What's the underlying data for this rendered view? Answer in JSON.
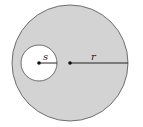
{
  "diagram": {
    "outer_circle": {
      "radius_label": "r",
      "fill": "#d3d3d3",
      "stroke": "#6e6e6e"
    },
    "inner_circle": {
      "radius_label": "s",
      "fill": "#ffffff",
      "stroke": "#6e6e6e"
    },
    "line_color": "#222222"
  }
}
